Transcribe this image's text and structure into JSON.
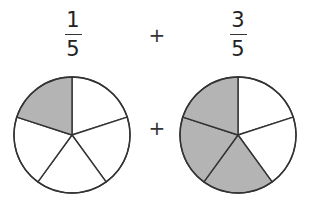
{
  "operator": "+",
  "fractions": [
    {
      "numerator": "1",
      "denominator": "5",
      "slices_total": 5,
      "slices_shaded": 1,
      "shaded_positions": [
        "top-left"
      ]
    },
    {
      "numerator": "3",
      "denominator": "5",
      "slices_total": 5,
      "slices_shaded": 3,
      "shaded_positions": [
        "top-left",
        "left",
        "bottom"
      ]
    }
  ],
  "colors": {
    "shaded_fill": "#b4b4b4",
    "unshaded_fill": "#ffffff",
    "stroke": "#333333",
    "text": "#222222"
  }
}
